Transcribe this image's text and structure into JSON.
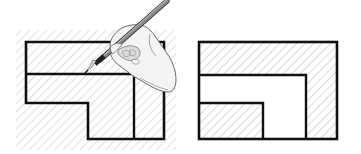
{
  "figure": {
    "description": "Section view hatching illustration: hand with pencil hatching a region, and resulting sectioned part",
    "colors": {
      "background": "#ffffff",
      "outline": "#111111",
      "hatch": "#c8c8c8",
      "pencil_body": "#8a8a8a",
      "pencil_dark": "#3a3a3a",
      "hand_fill": "#f4f4f4",
      "hand_line": "#6b6b6b"
    },
    "panels": [
      {
        "id": "left",
        "label": "Hand with pencil drawing hatch lines over the full section",
        "hatch_area": {
          "x": 16,
          "y": 30,
          "w": 160,
          "h": 120
        },
        "outline_points": "26,42 164,42 164,139 88,139 88,103 26,103",
        "divider_h": {
          "x1": 26,
          "y1": 74,
          "x2": 134,
          "y2": 74
        },
        "divider_v": {
          "x1": 134,
          "y1": 74,
          "x2": 134,
          "y2": 139
        }
      },
      {
        "id": "right",
        "label": "Finished section with inverted L hatched region",
        "outer_rect": {
          "x": 199,
          "y": 42,
          "w": 138,
          "h": 97
        },
        "white_region_points": "199,75 306,75 306,139 263,139 263,103 199,103"
      }
    ]
  }
}
